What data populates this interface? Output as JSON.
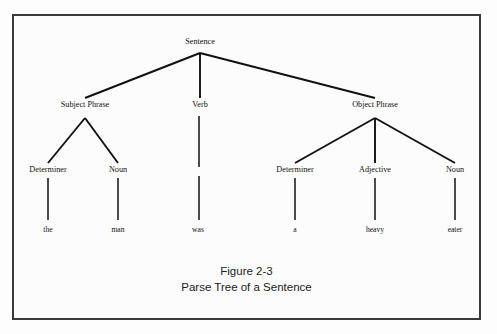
{
  "figure": {
    "caption_title": "Figure 2-3",
    "caption_subtitle": "Parse Tree of a Sentence",
    "border_color": "#3a3a3a",
    "ink_color": "#111111",
    "background_color": "#fcfcfc"
  },
  "tree": {
    "root": {
      "label": "Sentence",
      "x": 200,
      "y": 44
    },
    "level2": [
      {
        "label": "Subject Phrase",
        "x": 85,
        "y": 107
      },
      {
        "label": "Verb",
        "x": 200,
        "y": 107
      },
      {
        "label": "Object Phrase",
        "x": 375,
        "y": 107
      }
    ],
    "level3": [
      {
        "label": "Determiner",
        "x": 48,
        "y": 172
      },
      {
        "label": "Noun",
        "x": 118,
        "y": 172
      },
      {
        "label": "Determiner",
        "x": 295,
        "y": 172
      },
      {
        "label": "Adjective",
        "x": 375,
        "y": 172
      },
      {
        "label": "Noun",
        "x": 455,
        "y": 172
      }
    ],
    "leaves": [
      {
        "label": "the",
        "x": 48,
        "y": 232
      },
      {
        "label": "man",
        "x": 118,
        "y": 232
      },
      {
        "label": "was",
        "x": 198,
        "y": 232
      },
      {
        "label": "a",
        "x": 295,
        "y": 232
      },
      {
        "label": "heavy",
        "x": 375,
        "y": 232
      },
      {
        "label": "eater",
        "x": 455,
        "y": 232
      }
    ]
  }
}
